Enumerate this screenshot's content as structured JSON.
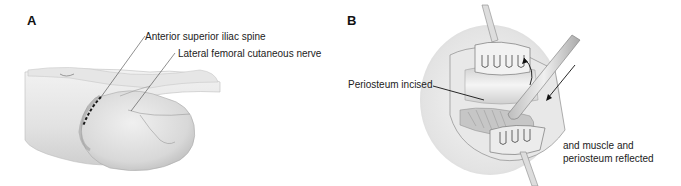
{
  "figure": {
    "panels": [
      {
        "letter": "A",
        "labels": {
          "asis": "Anterior superior iliac spine",
          "lfcn": "Lateral femoral cutaneous nerve"
        }
      },
      {
        "letter": "B",
        "labels": {
          "periosteum": "Periosteum incised",
          "reflected_line1": "and muscle and",
          "reflected_line2": "periosteum reflected"
        }
      }
    ]
  },
  "colors": {
    "line": "#333333",
    "skin_light": "#eeeeee",
    "skin_mid": "#d4d4d4",
    "skin_dark": "#a8a8a8",
    "incision": "#1a1a1a"
  }
}
